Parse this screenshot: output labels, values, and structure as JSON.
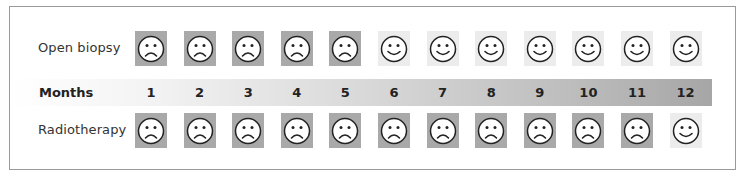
{
  "labels": {
    "row1": "Open biopsy",
    "band": "Months",
    "row2": "Radiotherapy"
  },
  "months": [
    "1",
    "2",
    "3",
    "4",
    "5",
    "6",
    "7",
    "8",
    "9",
    "10",
    "11",
    "12"
  ],
  "rows": [
    {
      "name": "Open biopsy",
      "faces": [
        "sad",
        "sad",
        "sad",
        "sad",
        "sad",
        "happy",
        "happy",
        "happy",
        "happy",
        "happy",
        "happy",
        "happy"
      ]
    },
    {
      "name": "Radiotherapy",
      "faces": [
        "sad",
        "sad",
        "sad",
        "sad",
        "sad",
        "sad",
        "sad",
        "sad",
        "sad",
        "sad",
        "sad",
        "happy"
      ]
    }
  ],
  "colors": {
    "sad_bg": "#a9a9a9",
    "happy_bg": "#ececec",
    "band_start": "#ffffff",
    "band_end": "#a6a6a6",
    "frame": "#9a9a9a"
  }
}
